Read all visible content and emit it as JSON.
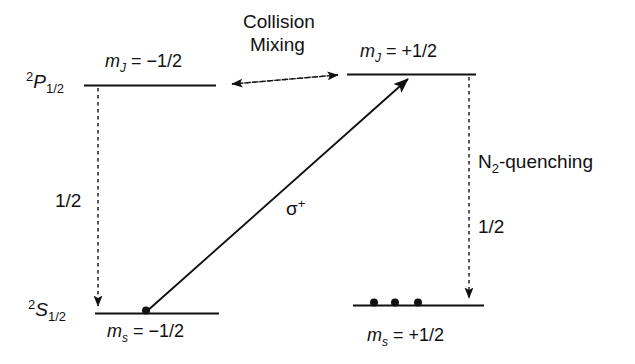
{
  "figure": {
    "type": "atomic-energy-level-diagram",
    "background_color": "#ffffff",
    "line_color": "#111111",
    "width": 635,
    "height": 364
  },
  "levels": {
    "upper_left": {
      "term_pre": "2",
      "term_symbol": "P",
      "term_sub": "1/2",
      "sublevel_label_m": "m",
      "sublevel_label_sub": "J",
      "sublevel_label_value": " = −1/2"
    },
    "upper_right": {
      "sublevel_label_m": "m",
      "sublevel_label_sub": "J",
      "sublevel_label_value": " = +1/2"
    },
    "lower_left": {
      "term_pre": "2",
      "term_symbol": "S",
      "term_sub": "1/2",
      "sublevel_label_m": "m",
      "sublevel_label_sub": "s",
      "sublevel_label_value": " = −1/2",
      "population_dots": 1
    },
    "lower_right": {
      "sublevel_label_m": "m",
      "sublevel_label_sub": "s",
      "sublevel_label_value": " = +1/2",
      "population_dots": 3
    }
  },
  "annotations": {
    "collision_mixing_line1": "Collision",
    "collision_mixing_line2": "Mixing",
    "quenching_n": "N",
    "quenching_sub": "2",
    "quenching_rest": "-quenching",
    "excitation_polarization_sigma": "σ",
    "excitation_polarization_sign": "+",
    "branching_left": "1/2",
    "branching_right": "1/2"
  }
}
